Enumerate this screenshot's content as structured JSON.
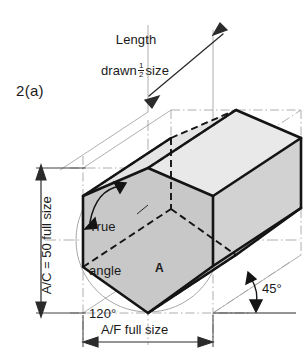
{
  "figure": {
    "label": "2(a)",
    "type": "engineering-isometric-drawing"
  },
  "annotations": {
    "length_note_line1": "Length",
    "length_note_line2_prefix": "drawn",
    "length_note_fraction_numerator": "1",
    "length_note_fraction_denominator": "2",
    "length_note_line2_suffix": "size",
    "true_angle_line1": "True",
    "true_angle_line2": "angle",
    "true_angle_value": "120°",
    "across_corners_label": "A/C = 50 full size",
    "across_flats_label": "A/F full size",
    "angle_45_label": "45°",
    "face_marker": "A"
  },
  "colors": {
    "front_face_fill": "#c8c8c8",
    "top_face_fill": "#e4e4e4",
    "side_face_fill": "#d6d6d6",
    "back_face_fill": "#dcdcdc",
    "outline": "#141414",
    "construction_line": "#9a9a9a",
    "hidden_line": "#141414",
    "dimension_line": "#2b2b2b",
    "circle_line": "#a8a8a8",
    "background": "#ffffff"
  },
  "geometry": {
    "hexagon_front_vertices": [
      [
        83,
        196
      ],
      [
        148,
        168
      ],
      [
        213,
        196
      ],
      [
        213,
        266
      ],
      [
        148,
        313
      ],
      [
        83,
        267
      ]
    ],
    "depth_offset_x": 88,
    "depth_offset_y": -58,
    "circumscribed_circle": {
      "center_x": 148,
      "center_y": 240,
      "radius": 72
    },
    "isometric_angle_degrees": 45,
    "true_angle_degrees": 120
  },
  "dimensions": {
    "across_corners_value": 50,
    "across_corners_scale": "full size",
    "across_flats_scale": "full size",
    "length_scale": "1/2 size"
  }
}
